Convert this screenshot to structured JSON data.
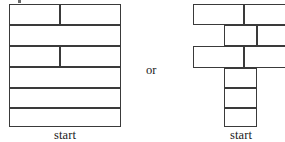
{
  "figure": {
    "background_color": "#ffffff",
    "stroke_color": "#3a3a3a",
    "text_color": "#1a1a1a",
    "conjunction": "or"
  },
  "left_diagram": {
    "name": "aligned-stack",
    "caption": "start",
    "description": "Rectangular wall of six full-width courses; courses 1 and 3 from top are split into two bricks",
    "rows": [
      {
        "index": 1,
        "bricks": 2,
        "split_fraction": 0.46
      },
      {
        "index": 2,
        "bricks": 1,
        "split_fraction": 0
      },
      {
        "index": 3,
        "bricks": 2,
        "split_fraction": 0.46
      },
      {
        "index": 4,
        "bricks": 1,
        "split_fraction": 0
      },
      {
        "index": 5,
        "bricks": 1,
        "split_fraction": 0
      },
      {
        "index": 6,
        "bricks": 1,
        "split_fraction": 0
      }
    ]
  },
  "right_diagram": {
    "name": "staggered-stack",
    "caption": "start",
    "description": "Offset brick arrangement forming a T shape with a narrow vertical stem of three bricks beneath three wide staggered courses",
    "rows": [
      {
        "index": 1,
        "bricks": 2,
        "offset": "wide-top-course"
      },
      {
        "index": 2,
        "bricks": 2,
        "offset": "inset-course"
      },
      {
        "index": 3,
        "bricks": 2,
        "offset": "wide-course"
      },
      {
        "index": 4,
        "bricks": 1,
        "offset": "stem"
      },
      {
        "index": 5,
        "bricks": 1,
        "offset": "stem"
      },
      {
        "index": 6,
        "bricks": 1,
        "offset": "stem"
      }
    ]
  }
}
